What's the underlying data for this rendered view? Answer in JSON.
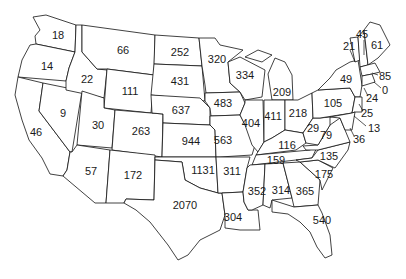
{
  "map": {
    "type": "choropleth-labels",
    "region": "Contiguous United States",
    "title_partial": "",
    "states": [
      {
        "code": "WA",
        "value": 18,
        "x": 58,
        "y": 36
      },
      {
        "code": "OR",
        "value": 14,
        "x": 47,
        "y": 67
      },
      {
        "code": "CA",
        "value": 46,
        "x": 36,
        "y": 133
      },
      {
        "code": "NV",
        "value": 9,
        "x": 63,
        "y": 114
      },
      {
        "code": "ID",
        "value": 22,
        "x": 87,
        "y": 80
      },
      {
        "code": "MT",
        "value": 66,
        "x": 123,
        "y": 51
      },
      {
        "code": "WY",
        "value": 111,
        "x": 130,
        "y": 92
      },
      {
        "code": "UT",
        "value": 30,
        "x": 98,
        "y": 126
      },
      {
        "code": "AZ",
        "value": 57,
        "x": 91,
        "y": 172
      },
      {
        "code": "CO",
        "value": 263,
        "x": 141,
        "y": 132
      },
      {
        "code": "NM",
        "value": 172,
        "x": 133,
        "y": 176
      },
      {
        "code": "ND",
        "value": 252,
        "x": 180,
        "y": 53
      },
      {
        "code": "SD",
        "value": 431,
        "x": 180,
        "y": 82
      },
      {
        "code": "NE",
        "value": 637,
        "x": 181,
        "y": 111
      },
      {
        "code": "KS",
        "value": 944,
        "x": 191,
        "y": 142
      },
      {
        "code": "OK",
        "value": 1131,
        "x": 203,
        "y": 171
      },
      {
        "code": "TX",
        "value": 2070,
        "x": 185,
        "y": 206
      },
      {
        "code": "MN",
        "value": 320,
        "x": 217,
        "y": 60
      },
      {
        "code": "IA",
        "value": 483,
        "x": 223,
        "y": 104
      },
      {
        "code": "MO",
        "value": 563,
        "x": 223,
        "y": 141
      },
      {
        "code": "AR",
        "value": 311,
        "x": 232,
        "y": 172
      },
      {
        "code": "LA",
        "value": 304,
        "x": 233,
        "y": 218
      },
      {
        "code": "WI",
        "value": 334,
        "x": 245,
        "y": 76
      },
      {
        "code": "IL",
        "value": 404,
        "x": 251,
        "y": 124
      },
      {
        "code": "MI",
        "value": 209,
        "x": 282,
        "y": 93
      },
      {
        "code": "IN",
        "value": 411,
        "x": 273,
        "y": 117
      },
      {
        "code": "OH",
        "value": 218,
        "x": 298,
        "y": 114
      },
      {
        "code": "KY",
        "value": 116,
        "x": 287,
        "y": 146
      },
      {
        "code": "TN",
        "value": 159,
        "x": 276,
        "y": 161
      },
      {
        "code": "MS",
        "value": 352,
        "x": 257,
        "y": 192
      },
      {
        "code": "AL",
        "value": 314,
        "x": 281,
        "y": 191
      },
      {
        "code": "GA",
        "value": 365,
        "x": 305,
        "y": 192
      },
      {
        "code": "FL",
        "value": 540,
        "x": 322,
        "y": 221
      },
      {
        "code": "SC",
        "value": 175,
        "x": 324,
        "y": 175
      },
      {
        "code": "NC",
        "value": 135,
        "x": 329,
        "y": 157
      },
      {
        "code": "VA",
        "value": 79,
        "x": 326,
        "y": 136
      },
      {
        "code": "WV",
        "value": 29,
        "x": 313,
        "y": 129
      },
      {
        "code": "PA",
        "value": 105,
        "x": 333,
        "y": 104
      },
      {
        "code": "NY",
        "value": 49,
        "x": 346,
        "y": 80
      },
      {
        "code": "VT",
        "value": 21,
        "x": 349,
        "y": 47
      },
      {
        "code": "NH",
        "value": 45,
        "x": 362,
        "y": 35
      },
      {
        "code": "ME",
        "value": 61,
        "x": 377,
        "y": 46
      },
      {
        "code": "MA",
        "value": 85,
        "x": 385,
        "y": 77
      },
      {
        "code": "RI",
        "value": 0,
        "x": 385,
        "y": 91
      },
      {
        "code": "CT",
        "value": 24,
        "x": 372,
        "y": 99
      },
      {
        "code": "NJ",
        "value": 25,
        "x": 367,
        "y": 114
      },
      {
        "code": "DE",
        "value": 13,
        "x": 374,
        "y": 129
      },
      {
        "code": "MD",
        "value": 36,
        "x": 359,
        "y": 140
      }
    ]
  }
}
